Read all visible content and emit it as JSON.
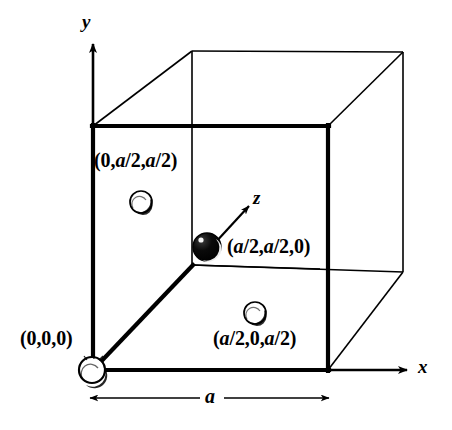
{
  "figure": {
    "background_color": "#ffffff",
    "line_color": "#000000"
  },
  "axes": {
    "y_label": "y",
    "x_label": "x",
    "z_label": "z"
  },
  "dimension": {
    "edge_label": "a"
  },
  "coordinate_labels": {
    "origin": "(0,0,0)",
    "left_face_center": "(0,a/2,a/2)",
    "body_point": "(a/2,a/2,0)",
    "bottom_face_center": "(a/2,0,a/2)"
  },
  "atoms": [
    {
      "name": "origin-atom",
      "type": "open-sphere",
      "cx": 92,
      "cy": 370,
      "r": 13,
      "fill": "#ffffff"
    },
    {
      "name": "left-face-atom",
      "type": "open-sphere",
      "cx": 141,
      "cy": 202,
      "r": 11,
      "fill": "#ffffff"
    },
    {
      "name": "bottom-face-atom",
      "type": "open-sphere",
      "cx": 255,
      "cy": 313,
      "r": 11,
      "fill": "#ffffff"
    },
    {
      "name": "body-atom",
      "type": "filled-sphere",
      "cx": 207,
      "cy": 247,
      "r": 14,
      "fill": "#000000"
    }
  ],
  "cube": {
    "front_top_left": [
      93,
      126
    ],
    "front_top_right": [
      328,
      126
    ],
    "front_bottom_left": [
      93,
      370
    ],
    "front_bottom_right": [
      328,
      370
    ],
    "back_top_left": [
      192,
      51
    ],
    "back_top_right": [
      403,
      52
    ],
    "back_bottom_left": [
      192,
      265
    ],
    "back_bottom_right": [
      403,
      272
    ]
  }
}
